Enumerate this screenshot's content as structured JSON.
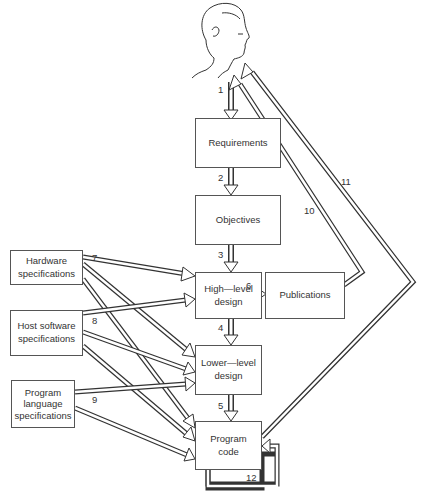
{
  "diagram": {
    "type": "flowchart",
    "actor": {
      "name": "user-head",
      "description": "profile sketch of a person's head"
    },
    "boxes": [
      {
        "id": "requirements",
        "label": "Requirements"
      },
      {
        "id": "objectives",
        "label": "Objectives"
      },
      {
        "id": "high_level_design",
        "label_line1": "High—level",
        "label_line2": "design"
      },
      {
        "id": "publications",
        "label": "Publications"
      },
      {
        "id": "lower_level_design",
        "label_line1": "Lower—level",
        "label_line2": "design"
      },
      {
        "id": "program_code",
        "label_line1": "Program",
        "label_line2": "code"
      },
      {
        "id": "hardware_specs",
        "label_line1": "Hardware",
        "label_line2": "specifications"
      },
      {
        "id": "host_software_specs",
        "label_line1": "Host software",
        "label_line2": "specifications"
      },
      {
        "id": "program_language_specs",
        "label_line1": "Program",
        "label_line2": "language",
        "label_line3": "specifications"
      }
    ],
    "edges": [
      {
        "label": "1",
        "from": "user-head",
        "to": "requirements"
      },
      {
        "label": "2",
        "from": "requirements",
        "to": "objectives"
      },
      {
        "label": "3",
        "from": "objectives",
        "to": "high_level_design"
      },
      {
        "label": "4",
        "from": "high_level_design",
        "to": "lower_level_design"
      },
      {
        "label": "5",
        "from": "lower_level_design",
        "to": "program_code"
      },
      {
        "label": "6",
        "from": "high_level_design",
        "to": "publications"
      },
      {
        "label": "7",
        "from": "hardware_specs",
        "to": [
          "high_level_design",
          "lower_level_design",
          "program_code"
        ]
      },
      {
        "label": "8",
        "from": "host_software_specs",
        "to": [
          "high_level_design",
          "lower_level_design",
          "program_code"
        ]
      },
      {
        "label": "9",
        "from": "program_language_specs",
        "to": [
          "lower_level_design",
          "program_code"
        ]
      },
      {
        "label": "10",
        "from": "publications",
        "to": "user-head"
      },
      {
        "label": "11",
        "from": "program_code",
        "to": "user-head"
      },
      {
        "label": "12",
        "from": "program_code",
        "to": "program_code"
      }
    ]
  },
  "labels": {
    "n1": "1",
    "n2": "2",
    "n3": "3",
    "n4": "4",
    "n5": "5",
    "n6": "6",
    "n7": "7",
    "n8": "8",
    "n9": "9",
    "n10": "10",
    "n11": "11",
    "n12": "12"
  }
}
